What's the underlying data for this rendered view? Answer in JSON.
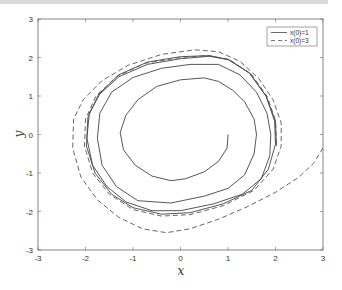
{
  "chart_data": {
    "type": "line",
    "title": "",
    "xlabel": "x",
    "ylabel": "y",
    "xlim": [
      -3,
      3
    ],
    "ylim": [
      -3,
      3
    ],
    "xticks": [
      "-3",
      "-2",
      "-1",
      "0",
      "1",
      "2",
      "3"
    ],
    "yticks": [
      "3",
      "2",
      "1",
      "0",
      "-1",
      "-2",
      "-3"
    ],
    "grid": false,
    "legend_position": "upper right",
    "series": [
      {
        "name": "x(0)=1",
        "style": "solid",
        "color": "#444444",
        "points": [
          [
            1.0,
            0.0
          ],
          [
            0.98,
            -0.35
          ],
          [
            0.8,
            -0.7
          ],
          [
            0.5,
            -0.97
          ],
          [
            0.1,
            -1.15
          ],
          [
            -0.2,
            -1.2
          ],
          [
            -0.6,
            -1.08
          ],
          [
            -0.95,
            -0.8
          ],
          [
            -1.2,
            -0.4
          ],
          [
            -1.27,
            0.05
          ],
          [
            -1.15,
            0.5
          ],
          [
            -0.9,
            0.9
          ],
          [
            -0.5,
            1.25
          ],
          [
            0.0,
            1.42
          ],
          [
            0.5,
            1.47
          ],
          [
            0.8,
            1.38
          ],
          [
            1.1,
            1.15
          ],
          [
            1.35,
            0.85
          ],
          [
            1.55,
            0.4
          ],
          [
            1.6,
            0.0
          ],
          [
            1.55,
            -0.5
          ],
          [
            1.35,
            -1.05
          ],
          [
            1.0,
            -1.4
          ],
          [
            0.5,
            -1.6
          ],
          [
            -0.2,
            -1.78
          ],
          [
            -0.9,
            -1.72
          ],
          [
            -1.35,
            -1.35
          ],
          [
            -1.65,
            -0.8
          ],
          [
            -1.75,
            -0.1
          ],
          [
            -1.7,
            0.55
          ],
          [
            -1.45,
            1.1
          ],
          [
            -1.0,
            1.48
          ],
          [
            -0.4,
            1.72
          ],
          [
            0.2,
            1.82
          ],
          [
            0.8,
            1.82
          ],
          [
            1.25,
            1.55
          ],
          [
            1.6,
            1.1
          ],
          [
            1.82,
            0.55
          ],
          [
            1.9,
            0.0
          ],
          [
            1.88,
            -0.55
          ],
          [
            1.7,
            -1.15
          ],
          [
            1.3,
            -1.55
          ],
          [
            0.7,
            -1.8
          ],
          [
            0.0,
            -1.98
          ],
          [
            -0.6,
            -1.98
          ],
          [
            -1.15,
            -1.75
          ],
          [
            -1.55,
            -1.35
          ],
          [
            -1.85,
            -0.8
          ],
          [
            -1.97,
            -0.1
          ],
          [
            -1.92,
            0.55
          ],
          [
            -1.7,
            1.05
          ],
          [
            -1.3,
            1.5
          ],
          [
            -0.7,
            1.82
          ],
          [
            0.0,
            1.97
          ],
          [
            0.6,
            2.03
          ],
          [
            1.0,
            1.95
          ],
          [
            1.45,
            1.6
          ],
          [
            1.8,
            1.0
          ],
          [
            1.98,
            0.35
          ],
          [
            2.0,
            -0.25
          ],
          [
            1.85,
            -0.9
          ],
          [
            1.5,
            -1.45
          ],
          [
            0.9,
            -1.8
          ],
          [
            0.2,
            -2.03
          ],
          [
            -0.4,
            -2.07
          ],
          [
            -1.0,
            -1.9
          ],
          [
            -1.45,
            -1.55
          ],
          [
            -1.8,
            -1.0
          ],
          [
            -1.98,
            -0.3
          ],
          [
            -1.95,
            0.45
          ],
          [
            -1.72,
            1.05
          ],
          [
            -1.3,
            1.55
          ],
          [
            -0.7,
            1.88
          ],
          [
            0.0,
            2.02
          ],
          [
            0.6,
            2.05
          ],
          [
            1.0,
            1.95
          ],
          [
            1.45,
            1.6
          ],
          [
            1.8,
            1.0
          ],
          [
            2.0,
            0.35
          ],
          [
            2.02,
            -0.3
          ]
        ]
      },
      {
        "name": "x(0)=3",
        "style": "dashed",
        "color": "#555555",
        "points": [
          [
            3.0,
            -0.35
          ],
          [
            2.8,
            -0.75
          ],
          [
            2.5,
            -1.1
          ],
          [
            2.0,
            -1.5
          ],
          [
            1.4,
            -1.88
          ],
          [
            0.8,
            -2.2
          ],
          [
            0.2,
            -2.45
          ],
          [
            -0.3,
            -2.55
          ],
          [
            -0.8,
            -2.45
          ],
          [
            -1.3,
            -2.15
          ],
          [
            -1.75,
            -1.7
          ],
          [
            -2.1,
            -1.1
          ],
          [
            -2.27,
            -0.35
          ],
          [
            -2.25,
            0.4
          ],
          [
            -2.05,
            0.9
          ],
          [
            -1.65,
            1.4
          ],
          [
            -1.1,
            1.8
          ],
          [
            -0.4,
            2.08
          ],
          [
            0.3,
            2.2
          ],
          [
            0.8,
            2.15
          ],
          [
            1.25,
            1.9
          ],
          [
            1.65,
            1.45
          ],
          [
            1.95,
            0.9
          ],
          [
            2.12,
            0.3
          ],
          [
            2.12,
            -0.3
          ],
          [
            1.95,
            -0.9
          ],
          [
            1.55,
            -1.45
          ],
          [
            0.9,
            -1.85
          ],
          [
            0.2,
            -2.08
          ],
          [
            -0.4,
            -2.12
          ],
          [
            -1.0,
            -1.95
          ],
          [
            -1.5,
            -1.55
          ],
          [
            -1.85,
            -1.0
          ],
          [
            -2.02,
            -0.3
          ],
          [
            -2.0,
            0.4
          ],
          [
            -1.78,
            1.0
          ],
          [
            -1.35,
            1.5
          ],
          [
            -0.75,
            1.85
          ],
          [
            0.0,
            2.0
          ],
          [
            0.6,
            2.05
          ],
          [
            1.05,
            1.93
          ],
          [
            1.5,
            1.55
          ],
          [
            1.83,
            0.98
          ],
          [
            2.0,
            0.35
          ],
          [
            2.02,
            -0.3
          ]
        ]
      }
    ]
  },
  "legend": {
    "entries": [
      {
        "label": "x(0)=1",
        "style": "solid"
      },
      {
        "label": "x(0)=3",
        "style": "dashed"
      }
    ]
  }
}
